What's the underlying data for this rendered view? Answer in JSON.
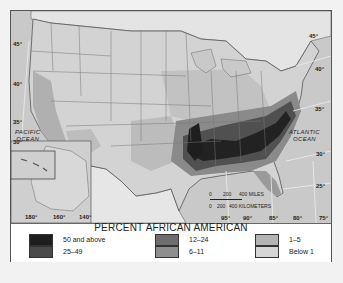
{
  "map": {
    "title": "PERCENT AFRICAN AMERICAN",
    "latitude_labels": [
      "45°",
      "40°",
      "35°",
      "30°"
    ],
    "right_latitude_labels": [
      "45°",
      "40°",
      "35°",
      "30°",
      "25°"
    ],
    "longitude_labels": [
      "95°",
      "90°",
      "85°",
      "80°",
      "75°"
    ],
    "alaska_longitudes": [
      "180°",
      "160°",
      "140°"
    ],
    "oceans": {
      "pacific": "PACIFIC\nOCEAN",
      "atlantic": "ATLANTIC\nOCEAN"
    },
    "scale": {
      "miles": [
        "0",
        "200",
        "400 MILES"
      ],
      "kilometers": [
        "0",
        "200",
        "400 KILOMETERS"
      ]
    }
  },
  "legend": {
    "title": "PERCENT AFRICAN AMERICAN",
    "items": [
      {
        "label": "50 and above",
        "color": "#1e1e1e"
      },
      {
        "label": "25–49",
        "color": "#4a4a4a"
      },
      {
        "label": "12–24",
        "color": "#6e6e6e"
      },
      {
        "label": "6–11",
        "color": "#8e8e8e"
      },
      {
        "label": "1–5",
        "color": "#b4b4b4"
      },
      {
        "label": "Below 1",
        "color": "#d6d6d6"
      }
    ]
  },
  "colors": {
    "ocean": "#c9c9c9",
    "land_base": "#d6d6d6",
    "canada": "#e2e2e2",
    "border": "#555555"
  }
}
